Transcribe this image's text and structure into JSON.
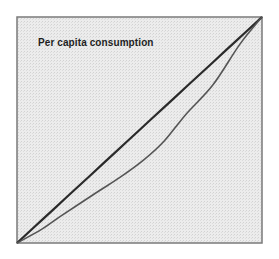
{
  "chart_data": {
    "type": "line",
    "title": "Per capita consumption",
    "xlabel": "",
    "ylabel": "",
    "xlim": [
      0,
      1
    ],
    "ylim": [
      0,
      1
    ],
    "grid": false,
    "legend": null,
    "series": [
      {
        "name": "Line of equality",
        "x": [
          0,
          0.1,
          0.2,
          0.3,
          0.4,
          0.5,
          0.6,
          0.7,
          0.8,
          0.9,
          1.0
        ],
        "y": [
          0,
          0.1,
          0.2,
          0.3,
          0.4,
          0.5,
          0.6,
          0.7,
          0.8,
          0.9,
          1.0
        ],
        "color": "#2a2a2a"
      },
      {
        "name": "Lorenz curve",
        "x": [
          0,
          0.1,
          0.18,
          0.32,
          0.42,
          0.52,
          0.6,
          0.69,
          0.8,
          0.91,
          1.0
        ],
        "y": [
          0,
          0.06,
          0.12,
          0.22,
          0.29,
          0.37,
          0.45,
          0.57,
          0.7,
          0.88,
          1.0
        ],
        "color": "#555555"
      }
    ],
    "plot_box": {
      "background": "#e9e9e9",
      "border": "#777777"
    }
  },
  "title": "Per capita consumption"
}
